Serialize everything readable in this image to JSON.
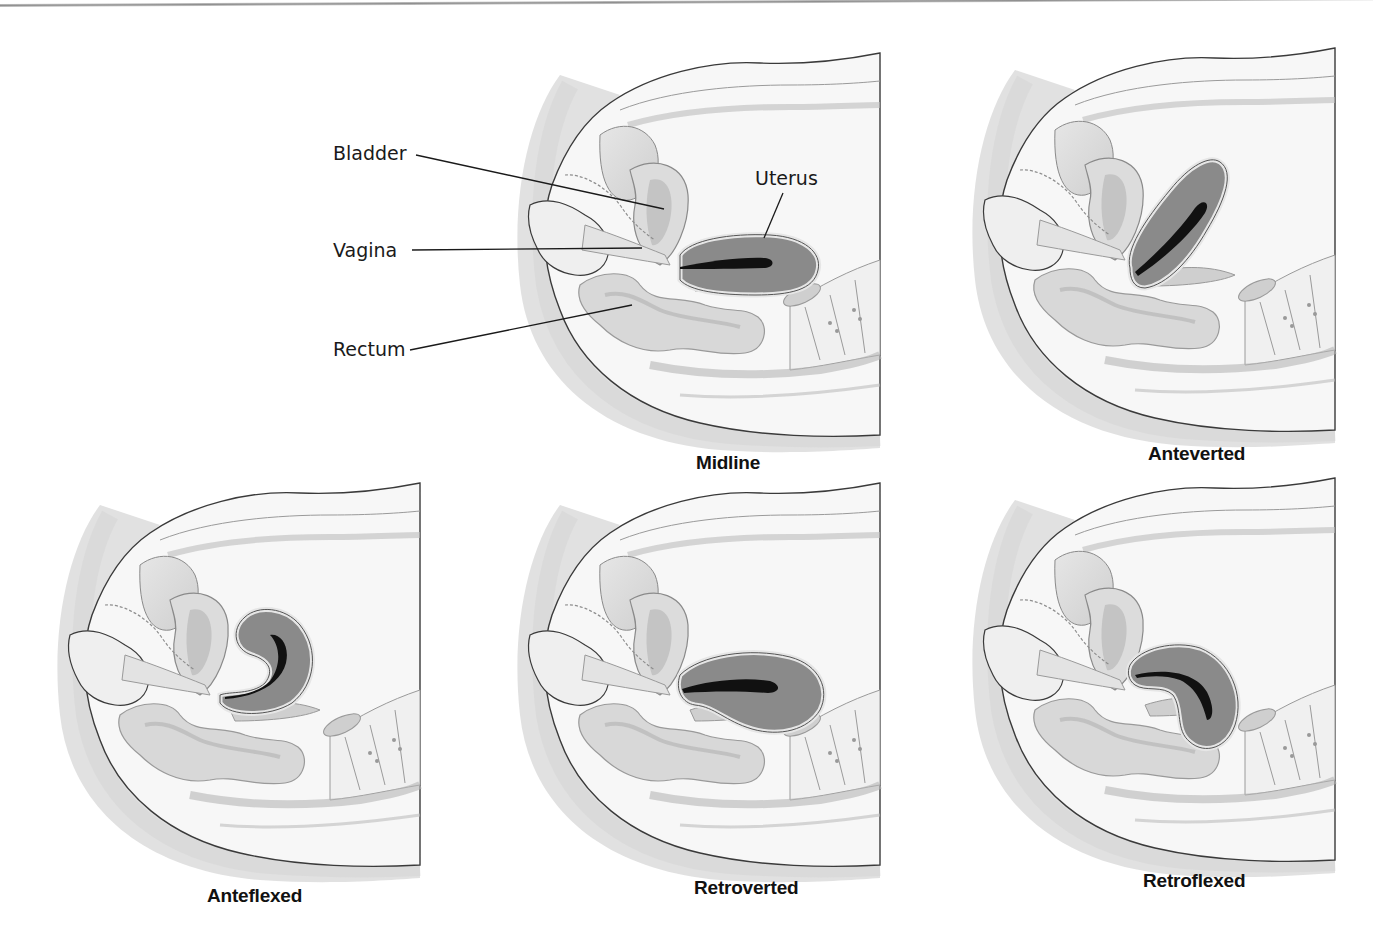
{
  "figure": {
    "type": "anatomical-diagram",
    "colors": {
      "uterus_fill": "#8a8a8a",
      "uterus_cavity": "#111111",
      "tissue_fill": "#f4f4f4",
      "outline": "#3a3a3a",
      "skin_shadow": "#bdbdbd",
      "leader_line": "#1a1a1a"
    }
  },
  "labels": {
    "bladder": "Bladder",
    "vagina": "Vagina",
    "rectum": "Rectum",
    "uterus": "Uterus"
  },
  "panels": [
    {
      "id": "midline",
      "caption": "Midline"
    },
    {
      "id": "anteverted",
      "caption": "Anteverted"
    },
    {
      "id": "anteflexed",
      "caption": "Anteflexed"
    },
    {
      "id": "retroverted",
      "caption": "Retroverted"
    },
    {
      "id": "retroflexed",
      "caption": "Retroflexed"
    }
  ]
}
